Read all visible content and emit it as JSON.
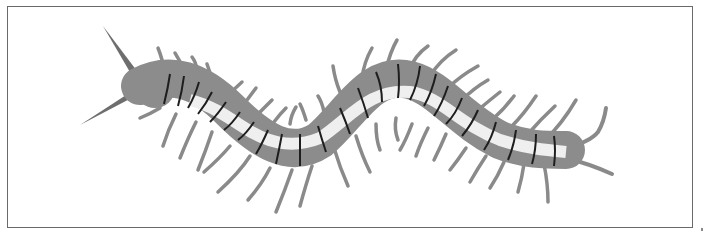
{
  "illustration": {
    "subject": "centipede",
    "style": "grayscale line illustration",
    "colors": {
      "body_dark": "#8c8c8c",
      "body_light": "#efefef",
      "segment_line": "#1e1e1e",
      "leg": "#9a9a9a",
      "antenna": "#6e6e6e",
      "frame": "#6a6a6a"
    }
  }
}
